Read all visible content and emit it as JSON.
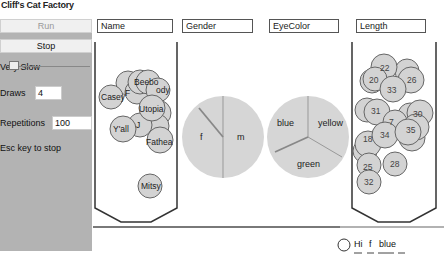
{
  "app": {
    "title": "Cliff's Cat Factory"
  },
  "controls": {
    "run_label": "Run",
    "stop_label": "Stop",
    "speed_label": "Very Slow",
    "draws_label": "Draws",
    "draws_value": "4",
    "repetitions_label": "Repetitions",
    "repetitions_value": "100",
    "hint": "Esc key to stop"
  },
  "columns": {
    "name": "Name",
    "gender": "Gender",
    "eyecolor": "EyeColor",
    "length": "Length"
  },
  "name_jar": {
    "balls": [
      "Casey",
      "F",
      "Beebo",
      "Cody",
      "Utopia",
      "Y'all",
      "J",
      "Fathea",
      "Mitsy"
    ]
  },
  "gender_spinner": {
    "sectors": [
      "f",
      "m"
    ]
  },
  "eyecolor_spinner": {
    "sectors": [
      "blue",
      "yellow",
      "green"
    ]
  },
  "length_jar": {
    "balls": [
      "22",
      "20",
      "26",
      "33",
      "31",
      "30",
      "7",
      "34",
      "35",
      "18",
      "25",
      "28",
      "32"
    ]
  },
  "result": {
    "label": "Hi",
    "gender": "f",
    "eyecolor": "blue",
    "length": ""
  },
  "colors": {
    "panel": "#b3b3b3",
    "ball": "#d3d3d3",
    "spinner": "#d6d6d6",
    "outline": "#333333"
  }
}
